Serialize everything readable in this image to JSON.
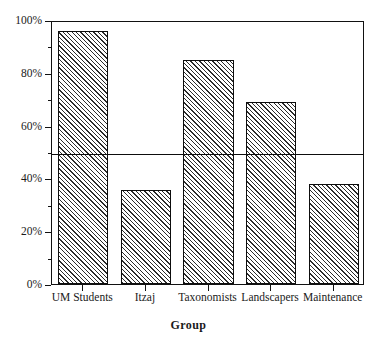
{
  "chart_data": {
    "type": "bar",
    "title": "",
    "subtitle": "",
    "xlabel": "Group",
    "ylabel": "",
    "categories": [
      "UM Students",
      "Itzaj",
      "Taxonomists",
      "Landscapers",
      "Maintenance"
    ],
    "values": [
      96,
      35.7,
      85,
      69,
      38
    ],
    "ylim": [
      0,
      100
    ],
    "ytick_labels": [
      "0%",
      "20%",
      "40%",
      "60%",
      "80%",
      "100%"
    ],
    "ytick_values": [
      0,
      20,
      40,
      60,
      80,
      100
    ],
    "yminor_values": [
      10,
      30,
      50,
      70,
      90
    ],
    "grid": false,
    "legend": "none",
    "annotations": [
      {
        "type": "hline",
        "value": 50,
        "label": ""
      }
    ],
    "bar_fill": "hatch-diagonal",
    "bar_edge_color": "#0d0d0d",
    "axis_color": "#111111"
  }
}
